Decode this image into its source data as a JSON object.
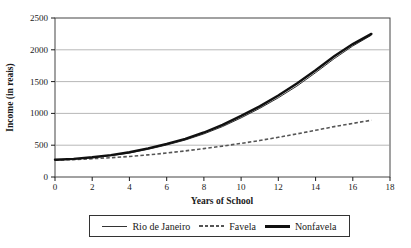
{
  "chart_data": {
    "type": "line",
    "title": "",
    "xlabel": "Years of School",
    "ylabel": "Income (in reais)",
    "xlim": [
      0,
      18
    ],
    "ylim": [
      0,
      2500
    ],
    "grid": "horizontal",
    "legend_position": "bottom",
    "xticks": [
      0,
      2,
      4,
      6,
      8,
      10,
      12,
      14,
      16,
      18
    ],
    "xtick_labels": [
      "0",
      "2",
      "4",
      "6",
      "8",
      "10",
      "12",
      "14",
      "16",
      "18"
    ],
    "yticks": [
      0,
      500,
      1000,
      1500,
      2000,
      2500
    ],
    "ytick_labels": [
      "0",
      "500",
      "1000",
      "1500",
      "2000",
      "2500"
    ],
    "x": [
      0,
      1,
      2,
      3,
      4,
      5,
      6,
      7,
      8,
      9,
      10,
      11,
      12,
      13,
      14,
      15,
      16,
      17
    ],
    "series": [
      {
        "name": "Rio de Janeiro",
        "style": "thin-solid",
        "color": "#333333",
        "values": [
          265,
          280,
          302,
          335,
          378,
          435,
          503,
          582,
          678,
          793,
          930,
          1078,
          1245,
          1430,
          1640,
          1860,
          2060,
          2230
        ]
      },
      {
        "name": "Favela",
        "style": "dashed",
        "color": "#555555",
        "values": [
          265,
          274,
          287,
          303,
          323,
          348,
          378,
          410,
          446,
          486,
          528,
          574,
          624,
          678,
          734,
          792,
          843,
          893
        ]
      },
      {
        "name": "Nonfavela",
        "style": "thick-solid",
        "color": "#101010",
        "values": [
          270,
          285,
          310,
          345,
          390,
          450,
          520,
          600,
          700,
          820,
          960,
          1110,
          1280,
          1470,
          1680,
          1900,
          2090,
          2250
        ]
      }
    ]
  }
}
